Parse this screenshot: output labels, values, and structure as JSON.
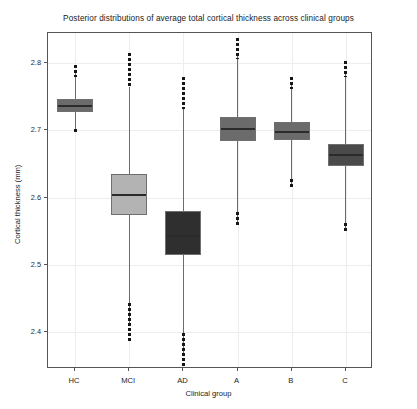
{
  "chart_data": {
    "type": "box",
    "title": "Posterior distributions of average total cortical thickness across clinical groups",
    "xlabel": "Clinical group",
    "ylabel": "Cortical thickness (mm)",
    "categories": [
      "HC",
      "MCI",
      "AD",
      "A",
      "B",
      "C"
    ],
    "ylim": [
      2.345,
      2.845
    ],
    "yticks": [
      2.4,
      2.5,
      2.6,
      2.7,
      2.8
    ],
    "ytick_labels": [
      "2.4",
      "2.5",
      "2.6",
      "2.7",
      "2.8"
    ],
    "grid": true,
    "legend": null,
    "boxes": [
      {
        "category": "HC",
        "color": "#6b6b6b",
        "q1": 2.7275,
        "median": 2.7375,
        "q3": 2.7475,
        "whisker_low": 2.7005,
        "whisker_high": 2.788,
        "outlier_low_min": 2.6975,
        "outlier_low_max": 2.7025,
        "outlier_high_min": 2.779,
        "outlier_high_max": 2.797
      },
      {
        "category": "MCI",
        "color": "#b3b3b3",
        "q1": 2.5745,
        "median": 2.605,
        "q3": 2.6345,
        "whisker_low": 2.411,
        "whisker_high": 2.764,
        "outlier_low_min": 2.387,
        "outlier_low_max": 2.443,
        "outlier_high_min": 2.764,
        "outlier_high_max": 2.815
      },
      {
        "category": "AD",
        "color": "#2f2f2f",
        "q1": 2.5145,
        "median": 2.544,
        "q3": 2.5805,
        "whisker_low": 2.3695,
        "whisker_high": 2.7325,
        "outlier_low_min": 2.348,
        "outlier_low_max": 2.399,
        "outlier_high_min": 2.7325,
        "outlier_high_max": 2.78
      },
      {
        "category": "A",
        "color": "#6b6b6b",
        "q1": 2.6845,
        "median": 2.7035,
        "q3": 2.7195,
        "whisker_low": 2.564,
        "whisker_high": 2.813,
        "outlier_low_min": 2.557,
        "outlier_low_max": 2.579,
        "outlier_high_min": 2.806,
        "outlier_high_max": 2.837
      },
      {
        "category": "B",
        "color": "#6b6b6b",
        "q1": 2.6855,
        "median": 2.699,
        "q3": 2.7125,
        "whisker_low": 2.6175,
        "whisker_high": 2.767,
        "outlier_low_min": 2.615,
        "outlier_low_max": 2.628,
        "outlier_high_min": 2.762,
        "outlier_high_max": 2.779
      },
      {
        "category": "C",
        "color": "#4a4a4a",
        "q1": 2.6475,
        "median": 2.6645,
        "q3": 2.6805,
        "whisker_low": 2.55,
        "whisker_high": 2.787,
        "outlier_low_min": 2.547,
        "outlier_low_max": 2.562,
        "outlier_high_min": 2.779,
        "outlier_high_max": 2.803
      }
    ]
  }
}
